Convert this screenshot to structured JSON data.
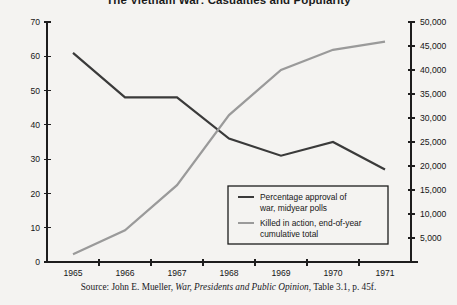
{
  "title": "The Vietnam War: Casualties and Popularity",
  "source": {
    "prefix": "Source: John E. Mueller, ",
    "book_title": "War, Presidents and Public Opinion",
    "suffix": ", Table 3.1, p. 45f."
  },
  "colors": {
    "background": "#f4f3f1",
    "axis": "#1d1d1d",
    "approval_line": "#3a3a3a",
    "killed_line": "#9a9a9a",
    "text": "#161616",
    "legend_border": "#1d1d1d"
  },
  "chart_data": {
    "type": "line",
    "title": "The Vietnam War: Casualties and Popularity",
    "xlabel": "",
    "ylabel": "",
    "grid": false,
    "legend_position": "inside-bottom-right",
    "categories": [
      "1965",
      "1966",
      "1967",
      "1968",
      "1969",
      "1970",
      "1971"
    ],
    "x_tick_labels": [
      "1965",
      "1966",
      "1967",
      "1968",
      "1969",
      "1970",
      "1971"
    ],
    "axes": {
      "left": {
        "label": "",
        "ylim": [
          0,
          70
        ],
        "ticks": [
          0,
          10,
          20,
          30,
          40,
          50,
          60,
          70
        ],
        "tick_labels": [
          "0",
          "10",
          "20",
          "30",
          "40",
          "50",
          "60",
          "70"
        ]
      },
      "right": {
        "label": "",
        "ylim": [
          0,
          50000
        ],
        "ticks": [
          0,
          5000,
          10000,
          15000,
          20000,
          25000,
          30000,
          35000,
          40000,
          45000,
          50000
        ],
        "tick_labels": [
          "",
          "5,000",
          "10,000",
          "15,000",
          "20,000",
          "25,000",
          "30,000",
          "35,000",
          "40,000",
          "45,000",
          "50,000"
        ]
      }
    },
    "series": [
      {
        "name": "Percentage approval of war, midyear polls",
        "axis": "left",
        "color": "#3a3a3a",
        "values": [
          61,
          48,
          48,
          36,
          31,
          35,
          27
        ]
      },
      {
        "name": "Killed in action, end-of-year cumulative total",
        "axis": "right",
        "color": "#9a9a9a",
        "values": [
          1600,
          6600,
          16000,
          30600,
          40000,
          44200,
          45900
        ]
      }
    ]
  },
  "legend": {
    "items": [
      {
        "color": "#3a3a3a",
        "line1": "Percentage approval of",
        "line2": "war, midyear polls"
      },
      {
        "color": "#9a9a9a",
        "line1": "Killed in action, end-of-year",
        "line2": "cumulative total"
      }
    ]
  }
}
